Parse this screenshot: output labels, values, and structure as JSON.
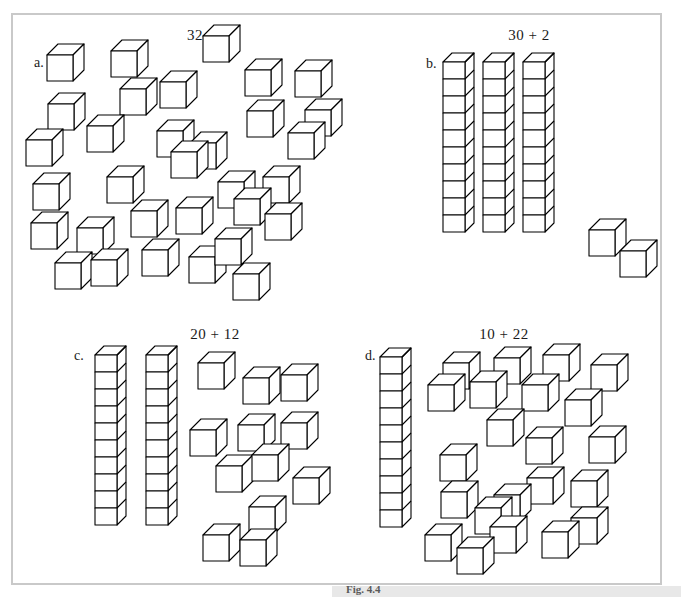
{
  "figure": {
    "caption": "Fig. 4.4",
    "background_color": "#ffffff",
    "frame_color": "#c9c9c9",
    "line_color": "#000000"
  },
  "panels": [
    {
      "letter": "a.",
      "title": "32",
      "rods": 0,
      "units": 32,
      "rod_cube_count": 10,
      "title_x": 195,
      "title_y": 27,
      "letter_x": 34,
      "letter_y": 55,
      "unit_positions": [
        [
          47,
          55
        ],
        [
          111,
          51
        ],
        [
          203,
          36
        ],
        [
          245,
          70
        ],
        [
          295,
          71
        ],
        [
          48,
          104
        ],
        [
          120,
          89
        ],
        [
          160,
          82
        ],
        [
          247,
          111
        ],
        [
          305,
          110
        ],
        [
          26,
          140
        ],
        [
          87,
          126
        ],
        [
          157,
          131
        ],
        [
          190,
          143
        ],
        [
          288,
          133
        ],
        [
          33,
          184
        ],
        [
          107,
          177
        ],
        [
          171,
          152
        ],
        [
          218,
          182
        ],
        [
          263,
          177
        ],
        [
          31,
          223
        ],
        [
          77,
          228
        ],
        [
          131,
          211
        ],
        [
          176,
          208
        ],
        [
          234,
          199
        ],
        [
          265,
          214
        ],
        [
          55,
          263
        ],
        [
          91,
          260
        ],
        [
          142,
          250
        ],
        [
          189,
          257
        ],
        [
          215,
          239
        ],
        [
          233,
          274
        ]
      ]
    },
    {
      "letter": "b.",
      "title": "30 + 2",
      "rods": 3,
      "units": 2,
      "rod_cube_count": 10,
      "title_x": 529,
      "title_y": 27,
      "letter_x": 426,
      "letter_y": 56,
      "rod_positions": [
        [
          443,
          62
        ],
        [
          483,
          62
        ],
        [
          523,
          62
        ]
      ],
      "unit_positions": [
        [
          589,
          230
        ],
        [
          620,
          251
        ]
      ]
    },
    {
      "letter": "c.",
      "title": "20 + 12",
      "rods": 2,
      "units": 12,
      "rod_cube_count": 10,
      "title_x": 215,
      "title_y": 326,
      "letter_x": 74,
      "letter_y": 348,
      "rod_positions": [
        [
          95,
          355
        ],
        [
          146,
          355
        ]
      ],
      "unit_positions": [
        [
          198,
          363
        ],
        [
          243,
          378
        ],
        [
          281,
          375
        ],
        [
          190,
          430
        ],
        [
          238,
          425
        ],
        [
          281,
          423
        ],
        [
          216,
          466
        ],
        [
          252,
          455
        ],
        [
          293,
          478
        ],
        [
          249,
          507
        ],
        [
          203,
          535
        ],
        [
          240,
          540
        ]
      ]
    },
    {
      "letter": "d.",
      "title": "10 + 22",
      "rods": 1,
      "units": 22,
      "rod_cube_count": 10,
      "title_x": 504,
      "title_y": 326,
      "letter_x": 365,
      "letter_y": 348,
      "rod_positions": [
        [
          380,
          357
        ]
      ],
      "unit_positions": [
        [
          443,
          363
        ],
        [
          494,
          358
        ],
        [
          543,
          355
        ],
        [
          591,
          365
        ],
        [
          428,
          385
        ],
        [
          470,
          382
        ],
        [
          522,
          385
        ],
        [
          565,
          400
        ],
        [
          487,
          420
        ],
        [
          526,
          438
        ],
        [
          589,
          437
        ],
        [
          440,
          455
        ],
        [
          527,
          478
        ],
        [
          571,
          481
        ],
        [
          441,
          492
        ],
        [
          494,
          495
        ],
        [
          571,
          518
        ],
        [
          475,
          508
        ],
        [
          490,
          527
        ],
        [
          542,
          532
        ],
        [
          425,
          535
        ],
        [
          457,
          548
        ]
      ]
    }
  ]
}
